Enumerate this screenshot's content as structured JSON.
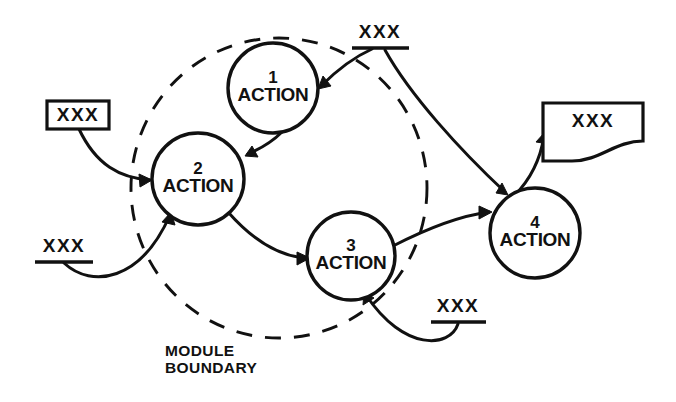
{
  "diagram": {
    "type": "data-flow-diagram",
    "title": "",
    "module_boundary": {
      "label_line1": "MODULE",
      "label_line2": "BOUNDARY",
      "style": "dashed-ellipse",
      "color": "#111111"
    },
    "processes": [
      {
        "id": "1",
        "number": "1",
        "label": "ACTION",
        "cx": 273,
        "cy": 88,
        "r": 45,
        "inside_boundary": true
      },
      {
        "id": "2",
        "number": "2",
        "label": "ACTION",
        "cx": 198,
        "cy": 179,
        "r": 46,
        "inside_boundary": true
      },
      {
        "id": "3",
        "number": "3",
        "label": "ACTION",
        "cx": 351,
        "cy": 256,
        "r": 44,
        "inside_boundary": true
      },
      {
        "id": "4",
        "number": "4",
        "label": "ACTION",
        "cx": 535,
        "cy": 233,
        "r": 45,
        "inside_boundary": false
      }
    ],
    "external_entities": [
      {
        "id": "entity-left",
        "label": "XXX",
        "shape": "rectangle",
        "x": 47,
        "y": 101,
        "width": 62,
        "height": 28
      },
      {
        "id": "entity-document",
        "label": "XXX",
        "shape": "document",
        "x": 543,
        "y": 103,
        "width": 100,
        "height": 58
      }
    ],
    "data_stores": [
      {
        "id": "store-top",
        "label": "XXX",
        "text_x": 380,
        "text_y": 33,
        "line_x1": 352,
        "line_x2": 409,
        "line_y": 48
      },
      {
        "id": "store-left-lower",
        "label": "XXX",
        "text_x": 64,
        "text_y": 247,
        "line_x1": 35,
        "line_x2": 93,
        "line_y": 262
      },
      {
        "id": "store-bottom-right",
        "label": "XXX",
        "text_x": 458,
        "text_y": 307,
        "line_x1": 431,
        "line_x2": 486,
        "line_y": 322
      }
    ],
    "flows": [
      {
        "id": "flow-entity-left-to-2",
        "from": "entity-left",
        "to": "2",
        "arrow": true
      },
      {
        "id": "flow-store-left-to-2",
        "from": "store-left-lower",
        "to": "2",
        "arrow": true
      },
      {
        "id": "flow-1-to-2",
        "from": "1",
        "to": "2",
        "arrow": true
      },
      {
        "id": "flow-store-top-to-1",
        "from": "store-top",
        "to": "1",
        "arrow": true
      },
      {
        "id": "flow-2-to-3",
        "from": "2",
        "to": "3",
        "arrow": true
      },
      {
        "id": "flow-3-to-4",
        "from": "3",
        "to": "4",
        "arrow": true
      },
      {
        "id": "flow-store-top-to-4",
        "from": "store-top",
        "to": "4",
        "arrow": true
      },
      {
        "id": "flow-store-br-to-3",
        "from": "store-bottom-right",
        "to": "3",
        "arrow": true
      },
      {
        "id": "flow-4-to-document",
        "from": "4",
        "to": "entity-document",
        "arrow": true
      }
    ]
  }
}
